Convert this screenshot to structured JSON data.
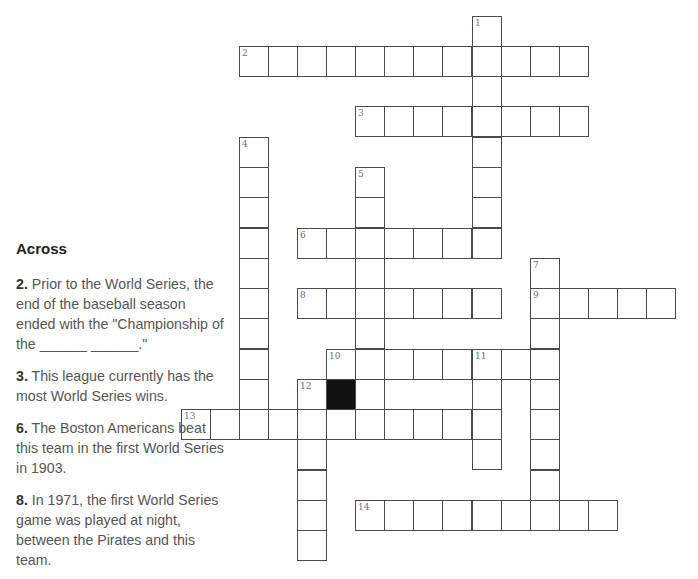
{
  "puzzle": {
    "grid_geometry": {
      "col_x": [
        181,
        210,
        239,
        268,
        297,
        326,
        355,
        384,
        413,
        442,
        472,
        501,
        530,
        559,
        588,
        617,
        646
      ],
      "row_y": [
        16,
        46,
        76,
        106,
        137,
        167,
        197,
        228,
        258,
        288,
        318,
        349,
        379,
        409,
        439,
        470,
        500,
        530
      ]
    },
    "words": [
      {
        "number": "1",
        "direction": "down",
        "row": 0,
        "col": 10,
        "length": 8
      },
      {
        "number": "2",
        "direction": "across",
        "row": 1,
        "col": 2,
        "length": 12
      },
      {
        "number": "3",
        "direction": "across",
        "row": 3,
        "col": 6,
        "length": 8
      },
      {
        "number": "4",
        "direction": "down",
        "row": 4,
        "col": 2,
        "length": 10
      },
      {
        "number": "5",
        "direction": "down",
        "row": 5,
        "col": 6,
        "length": 9
      },
      {
        "number": "6",
        "direction": "across",
        "row": 7,
        "col": 4,
        "length": 7
      },
      {
        "number": "7",
        "direction": "down",
        "row": 8,
        "col": 12,
        "length": 9
      },
      {
        "number": "8",
        "direction": "across",
        "row": 9,
        "col": 4,
        "length": 7
      },
      {
        "number": "9",
        "direction": "across",
        "row": 9,
        "col": 12,
        "length": 5
      },
      {
        "number": "10",
        "direction": "across",
        "row": 11,
        "col": 5,
        "length": 8
      },
      {
        "number": "11",
        "direction": "down",
        "row": 11,
        "col": 10,
        "length": 4
      },
      {
        "number": "12",
        "direction": "down",
        "row": 12,
        "col": 4,
        "length": 6
      },
      {
        "number": "13",
        "direction": "across",
        "row": 13,
        "col": 0,
        "length": 11
      },
      {
        "number": "14",
        "direction": "across",
        "row": 16,
        "col": 6,
        "length": 9
      }
    ],
    "black_cells": [
      {
        "row": 12,
        "col": 5
      }
    ],
    "colors": {
      "border": "#4a4a4a",
      "black_cell": "#111111",
      "number": "#6e6e6e"
    }
  },
  "clues": {
    "across_heading": "Across",
    "across": [
      {
        "number": "2.",
        "text": " Prior to the World Series, the end of the baseball season ended with the \"Championship of the ______ ______.\""
      },
      {
        "number": "3.",
        "text": " This league currently has the most World Series wins."
      },
      {
        "number": "6.",
        "text": " The Boston Americans beat this team in the first World Series in 1903."
      },
      {
        "number": "8.",
        "text": " In 1971, the first World Series game was played at night, between the Pirates and this team."
      }
    ]
  }
}
